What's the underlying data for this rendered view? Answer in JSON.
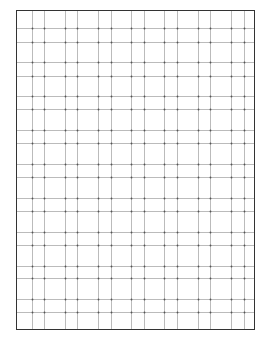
{
  "sheet": {
    "type": "grid-paper",
    "border_color": "#333333",
    "line_color": "#bbbbbb",
    "dot_color": "#555555",
    "frame": {
      "left": 16,
      "top": 10,
      "right": 255,
      "bottom": 330
    },
    "vertical_lines": [
      32,
      44,
      65,
      77,
      98,
      111,
      131,
      144,
      164,
      177,
      198,
      210,
      231,
      244
    ],
    "horizontal_lines": [
      28,
      42,
      62,
      76,
      96,
      109,
      130,
      143,
      164,
      177,
      198,
      211,
      232,
      245,
      266,
      278,
      299,
      312
    ]
  }
}
